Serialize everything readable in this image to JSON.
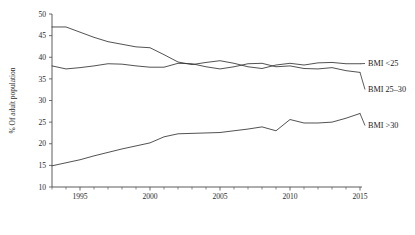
{
  "chart_data": {
    "type": "line",
    "title": "",
    "subtitle": "",
    "xlabel": "",
    "ylabel": "% Of adult population",
    "xlim": [
      1993,
      2015
    ],
    "ylim": [
      10,
      50
    ],
    "grid": false,
    "legend_position": "right-inline-labels",
    "y_ticks": [
      10,
      15,
      20,
      25,
      30,
      35,
      40,
      45,
      50
    ],
    "y_tick_labels": [
      "10",
      "15",
      "20",
      "25",
      "30",
      "35",
      "40",
      "45",
      "50"
    ],
    "x_ticks_major": [
      1995,
      2000,
      2005,
      2010,
      2015
    ],
    "x_tick_labels": [
      "1995",
      "2000",
      "2005",
      "2010",
      "2015"
    ],
    "x_ticks_minor": [
      1993,
      1994,
      1996,
      1997,
      1998,
      1999,
      2001,
      2002,
      2003,
      2004,
      2006,
      2007,
      2008,
      2009,
      2011,
      2012,
      2013,
      2014
    ],
    "x": [
      1993,
      1994,
      1995,
      1996,
      1997,
      1998,
      1999,
      2000,
      2001,
      2002,
      2003,
      2004,
      2005,
      2006,
      2007,
      2008,
      2009,
      2010,
      2011,
      2012,
      2013,
      2014,
      2015
    ],
    "series": [
      {
        "name": "BMI <25",
        "label": "BMI <25",
        "color": "#333333",
        "values": [
          47.0,
          47.0,
          45.8,
          44.6,
          43.6,
          43.0,
          42.4,
          42.2,
          40.6,
          38.9,
          38.3,
          38.8,
          39.2,
          38.6,
          37.8,
          37.4,
          38.2,
          38.6,
          38.2,
          38.7,
          38.8,
          38.5,
          38.5
        ]
      },
      {
        "name": "BMI 25-30",
        "label": "BMI 25–30",
        "color": "#333333",
        "values": [
          38.0,
          37.3,
          37.6,
          38.0,
          38.5,
          38.4,
          38.0,
          37.7,
          37.7,
          38.6,
          38.5,
          37.8,
          37.3,
          37.8,
          38.5,
          38.6,
          37.8,
          38.0,
          37.4,
          37.3,
          37.6,
          36.9,
          36.5
        ]
      },
      {
        "name": "BMI >30",
        "label": "BMI >30",
        "color": "#333333",
        "values": [
          14.9,
          15.6,
          16.3,
          17.2,
          18.0,
          18.8,
          19.5,
          20.2,
          21.6,
          22.3,
          22.4,
          22.5,
          22.6,
          23.0,
          23.4,
          23.9,
          23.0,
          25.6,
          24.8,
          24.8,
          25.0,
          25.9,
          27.0
        ]
      }
    ],
    "series_label_anchors": [
      {
        "name": "BMI <25",
        "x_px": 368,
        "y_px": 66
      },
      {
        "name": "BMI 25-30",
        "x_px": 368,
        "y_px": 92
      },
      {
        "name": "BMI >30",
        "x_px": 368,
        "y_px": 128
      }
    ]
  },
  "axes": {
    "y_axis_title": "% Of adult population"
  }
}
